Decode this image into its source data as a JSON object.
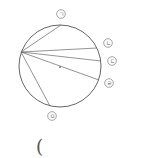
{
  "diagram": {
    "type": "circle-chords",
    "circle": {
      "cx": 60,
      "cy": 66,
      "r": 41,
      "stroke": "#555555"
    },
    "center_dot": {
      "x": 60,
      "y": 67
    },
    "origin_point": {
      "x": 21,
      "y": 52
    },
    "chords": [
      {
        "label": "ㄱ",
        "end": {
          "x": 61,
          "y": 25
        },
        "label_pos": {
          "x": 61,
          "y": 14
        }
      },
      {
        "label": "ㄴ",
        "end": {
          "x": 97,
          "y": 48
        },
        "label_pos": {
          "x": 108,
          "y": 43
        }
      },
      {
        "label": "ㄷ",
        "end": {
          "x": 101,
          "y": 61
        },
        "label_pos": {
          "x": 112,
          "y": 61
        }
      },
      {
        "label": "ㄹ",
        "end": {
          "x": 99,
          "y": 80
        },
        "label_pos": {
          "x": 109,
          "y": 83
        }
      },
      {
        "label": "ㅁ",
        "end": {
          "x": 50,
          "y": 106
        },
        "label_pos": {
          "x": 52,
          "y": 116
        }
      }
    ],
    "answer_paren": "("
  }
}
